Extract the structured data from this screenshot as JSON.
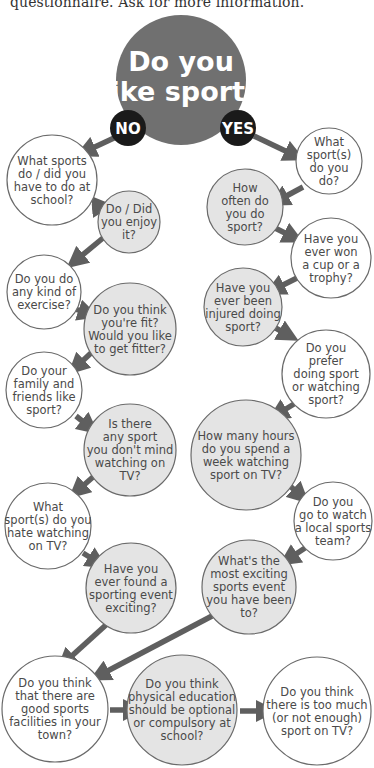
{
  "intro_text": "questionnaire. Ask for more information.",
  "colors": {
    "title_circle": "#707070",
    "badge": "#1a1a1a",
    "arrow": "#5f5f5f",
    "circle_stroke": "#6a6a6a",
    "white_fill": "#ffffff",
    "grey_fill": "#e4e4e4"
  },
  "title": {
    "lines": [
      "Do you",
      "like sport?"
    ],
    "cx": 181,
    "cy": 80,
    "r": 65
  },
  "badges": [
    {
      "id": "no",
      "label": "NO",
      "cx": 128,
      "cy": 128,
      "r": 18
    },
    {
      "id": "yes",
      "label": "YES",
      "cx": 238,
      "cy": 128,
      "r": 18
    }
  ],
  "questions": [
    {
      "id": "q_school",
      "lines": [
        "What sports",
        "do / did you",
        "have to do at",
        "school?"
      ],
      "cx": 52,
      "cy": 180,
      "r": 45,
      "fill": "white"
    },
    {
      "id": "q_enjoy",
      "lines": [
        "Do / Did",
        "you enjoy",
        "it?"
      ],
      "cx": 129,
      "cy": 222,
      "r": 31,
      "fill": "grey"
    },
    {
      "id": "q_exercise",
      "lines": [
        "Do you do",
        "any kind of",
        "exercise?"
      ],
      "cx": 44,
      "cy": 292,
      "r": 37,
      "fill": "white"
    },
    {
      "id": "q_fit",
      "lines": [
        "Do you think",
        "you're fit?",
        "Would you like",
        "to get fitter?"
      ],
      "cx": 130,
      "cy": 329,
      "r": 46,
      "fill": "grey"
    },
    {
      "id": "q_family",
      "lines": [
        "Do your",
        "family and",
        "friends like",
        "sport?"
      ],
      "cx": 44,
      "cy": 390,
      "r": 38,
      "fill": "white"
    },
    {
      "id": "q_dontmind",
      "lines": [
        "Is there",
        "any sport",
        "you don't mind",
        "watching on",
        "TV?"
      ],
      "cx": 130,
      "cy": 450,
      "r": 46,
      "fill": "grey"
    },
    {
      "id": "q_hate",
      "lines": [
        "What",
        "sport(s) do you",
        "hate watching",
        "on TV?"
      ],
      "cx": 48,
      "cy": 526,
      "r": 43,
      "fill": "white"
    },
    {
      "id": "q_found",
      "lines": [
        "Have you",
        "ever found a",
        "sporting event",
        "exciting?"
      ],
      "cx": 131,
      "cy": 588,
      "r": 45,
      "fill": "grey"
    },
    {
      "id": "q_whatsport",
      "lines": [
        "What",
        "sport(s)",
        "do you",
        "do?"
      ],
      "cx": 329,
      "cy": 161,
      "r": 33,
      "fill": "white"
    },
    {
      "id": "q_often",
      "lines": [
        "How",
        "often do",
        "you do",
        "sport?"
      ],
      "cx": 245,
      "cy": 207,
      "r": 38,
      "fill": "grey"
    },
    {
      "id": "q_won",
      "lines": [
        "Have you",
        "ever won",
        "a cup or a",
        "trophy?"
      ],
      "cx": 331,
      "cy": 258,
      "r": 40,
      "fill": "white"
    },
    {
      "id": "q_injured",
      "lines": [
        "Have you",
        "ever been",
        "injured doing",
        "sport?"
      ],
      "cx": 243,
      "cy": 307,
      "r": 39,
      "fill": "grey"
    },
    {
      "id": "q_prefer",
      "lines": [
        "Do you",
        "prefer",
        "doing sport",
        "or watching",
        "sport?"
      ],
      "cx": 326,
      "cy": 374,
      "r": 44,
      "fill": "white"
    },
    {
      "id": "q_hours",
      "lines": [
        "How many hours",
        "do you spend a",
        "week watching",
        "sport on TV?"
      ],
      "cx": 246,
      "cy": 455,
      "r": 55,
      "fill": "grey"
    },
    {
      "id": "q_local",
      "lines": [
        "Do you",
        "go to watch",
        "a local sports",
        "team?"
      ],
      "cx": 333,
      "cy": 521,
      "r": 39,
      "fill": "white"
    },
    {
      "id": "q_exciting",
      "lines": [
        "What's the",
        "most exciting",
        "sports event",
        "you have been",
        "to?"
      ],
      "cx": 249,
      "cy": 587,
      "r": 47,
      "fill": "grey"
    },
    {
      "id": "q_facilities",
      "lines": [
        "Do you think",
        "that there are",
        "good sports",
        "facilities in your",
        "town?"
      ],
      "cx": 55,
      "cy": 709,
      "r": 53,
      "fill": "white"
    },
    {
      "id": "q_pe",
      "lines": [
        "Do you think",
        "physical education",
        "should be optional",
        "or compulsory at",
        "school?"
      ],
      "cx": 182,
      "cy": 710,
      "r": 55,
      "fill": "grey"
    },
    {
      "id": "q_toomuch",
      "lines": [
        "Do you think",
        "there is too much",
        "(or not enough)",
        "sport on TV?"
      ],
      "cx": 317,
      "cy": 711,
      "r": 54,
      "fill": "white"
    }
  ],
  "arrows": [
    {
      "x1": 114,
      "y1": 138,
      "x2": 84,
      "y2": 152
    },
    {
      "x1": 92,
      "y1": 207,
      "x2": 104,
      "y2": 206
    },
    {
      "x1": 103,
      "y1": 238,
      "x2": 74,
      "y2": 262
    },
    {
      "x1": 75,
      "y1": 309,
      "x2": 90,
      "y2": 314
    },
    {
      "x1": 91,
      "y1": 353,
      "x2": 75,
      "y2": 368
    },
    {
      "x1": 76,
      "y1": 416,
      "x2": 91,
      "y2": 428
    },
    {
      "x1": 93,
      "y1": 477,
      "x2": 76,
      "y2": 492
    },
    {
      "x1": 83,
      "y1": 553,
      "x2": 99,
      "y2": 563
    },
    {
      "x1": 254,
      "y1": 136,
      "x2": 296,
      "y2": 156
    },
    {
      "x1": 303,
      "y1": 187,
      "x2": 277,
      "y2": 201
    },
    {
      "x1": 275,
      "y1": 228,
      "x2": 295,
      "y2": 238
    },
    {
      "x1": 297,
      "y1": 278,
      "x2": 273,
      "y2": 290
    },
    {
      "x1": 272,
      "y1": 326,
      "x2": 290,
      "y2": 336
    },
    {
      "x1": 294,
      "y1": 404,
      "x2": 276,
      "y2": 415
    },
    {
      "x1": 289,
      "y1": 485,
      "x2": 302,
      "y2": 497
    },
    {
      "x1": 305,
      "y1": 548,
      "x2": 287,
      "y2": 560
    },
    {
      "x1": 107,
      "y1": 624,
      "x2": 64,
      "y2": 663
    },
    {
      "x1": 212,
      "y1": 616,
      "x2": 98,
      "y2": 676
    },
    {
      "x1": 110,
      "y1": 710,
      "x2": 135,
      "y2": 710
    },
    {
      "x1": 240,
      "y1": 711,
      "x2": 268,
      "y2": 711
    }
  ]
}
